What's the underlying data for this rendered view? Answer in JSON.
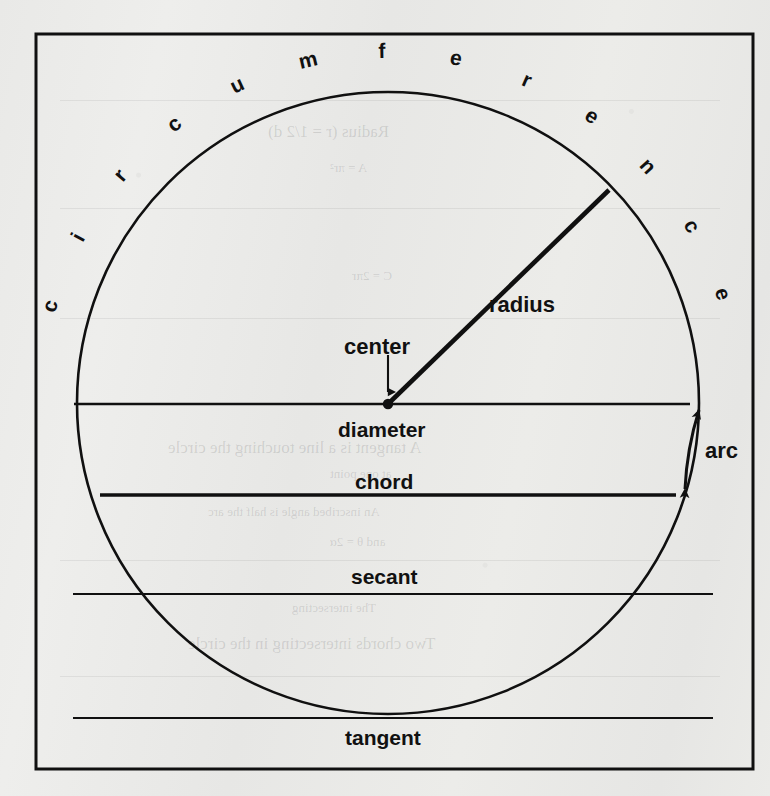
{
  "page": {
    "kind": "textbook-figure",
    "paper_color": "#eaeae8",
    "ink_color": "#101010"
  },
  "figure": {
    "frame": {
      "x": 36,
      "y": 34,
      "width": 717,
      "height": 735
    },
    "circle": {
      "cx": 388,
      "cy": 403,
      "r": 311,
      "stroke_width": 2.6
    },
    "center_dot": {
      "cx": 388,
      "cy": 404,
      "r": 5
    }
  },
  "circumference_label": {
    "text": "circumference",
    "letters": [
      "c",
      "i",
      "r",
      "c",
      "u",
      "m",
      "f",
      "e",
      "r",
      "e",
      "n",
      "c",
      "e"
    ],
    "note": "letters set individually along the outside of the arc, each rotated tangent to the circle"
  },
  "labels": {
    "radius": "radius",
    "center": "center",
    "diameter": "diameter",
    "chord": "chord",
    "arc": "arc",
    "secant": "secant",
    "tangent": "tangent"
  },
  "lines": {
    "diameter": {
      "x1": 74,
      "y1": 404,
      "x2": 690,
      "y2": 404,
      "stroke_width": 2.4,
      "label_at": [
        388,
        432
      ]
    },
    "chord": {
      "x1": 100,
      "y1": 495,
      "x2": 676,
      "y2": 495,
      "stroke_width": 3.6,
      "label_at": [
        388,
        486
      ]
    },
    "secant": {
      "x1": 73,
      "y1": 594,
      "x2": 713,
      "y2": 594,
      "stroke_width": 2.0,
      "label_at": [
        388,
        578
      ]
    },
    "tangent": {
      "x1": 73,
      "y1": 718,
      "x2": 713,
      "y2": 718,
      "stroke_width": 2.2,
      "label_at": [
        388,
        740
      ]
    },
    "radius": {
      "x1": 388,
      "y1": 404,
      "x2": 609,
      "y2": 190,
      "stroke_width": 4.5,
      "label_at": [
        520,
        306
      ]
    }
  },
  "arrows": {
    "center_pointer": {
      "from": [
        388,
        357
      ],
      "to": [
        388,
        396
      ],
      "label_at": [
        388,
        348
      ]
    },
    "arc_marker": {
      "description": "double-headed arrow drawn on the circle between the diameter line and the chord line",
      "from_angle_deg": 0,
      "to_angle_deg": 17,
      "label_at": [
        718,
        455
      ]
    }
  },
  "ghost_text": [
    {
      "text": "Radius (r = 1/2 d)",
      "x": 268,
      "y": 122,
      "size": "big"
    },
    {
      "text": "A = πr²",
      "x": 330,
      "y": 160,
      "size": "sm"
    },
    {
      "text": "C = 2πr",
      "x": 352,
      "y": 268,
      "size": "sm"
    },
    {
      "text": "A tangent is a line touching the circle",
      "x": 168,
      "y": 438,
      "size": "big"
    },
    {
      "text": "at one point",
      "x": 330,
      "y": 466,
      "size": "sm"
    },
    {
      "text": "An inscribed angle is half the arc",
      "x": 208,
      "y": 504,
      "size": "sm"
    },
    {
      "text": "and θ = 2α",
      "x": 330,
      "y": 534,
      "size": "sm"
    },
    {
      "text": "The intersecting",
      "x": 292,
      "y": 600,
      "size": "sm"
    },
    {
      "text": "Two chords intersecting in the circle",
      "x": 188,
      "y": 634,
      "size": "big"
    }
  ],
  "ghost_rules": [
    {
      "x": 60,
      "y": 100,
      "width": 660
    },
    {
      "x": 60,
      "y": 208,
      "width": 660
    },
    {
      "x": 60,
      "y": 318,
      "width": 660
    },
    {
      "x": 60,
      "y": 560,
      "width": 660
    },
    {
      "x": 60,
      "y": 676,
      "width": 660
    }
  ]
}
